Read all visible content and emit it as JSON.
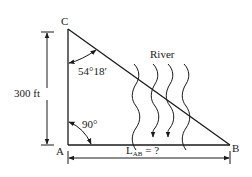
{
  "figure": {
    "points": {
      "A": "A",
      "B": "B",
      "C": "C"
    },
    "labels": {
      "height": "300 ft",
      "angle_c": "54°18′",
      "angle_a": "90°",
      "river": "River",
      "length_main": "L",
      "length_sub": "AB",
      "length_suffix": " = ?"
    },
    "river_lines": 4,
    "river_arrows_on": [
      1,
      2
    ]
  }
}
